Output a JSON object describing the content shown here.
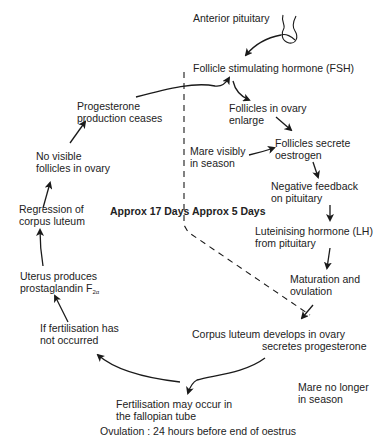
{
  "diagram": {
    "colors": {
      "text": "#222222",
      "lines": "#1a1a1a",
      "background": "#ffffff"
    },
    "nodes": {
      "anterior_pituitary": {
        "lines": [
          "Anterior pituitary"
        ]
      },
      "fsh": {
        "lines": [
          "Follicle stimulating hormone (FSH)"
        ]
      },
      "follicles_enlarge": {
        "lines": [
          "Follicles in ovary",
          "enlarge"
        ]
      },
      "mare_in_season": {
        "lines": [
          "Mare visibly",
          "in season"
        ]
      },
      "follicles_oestrogen": {
        "lines": [
          "Follicles secrete",
          "oestrogen"
        ]
      },
      "negative_feedback": {
        "lines": [
          "Negative feedback",
          "on pituitary"
        ]
      },
      "lh": {
        "lines": [
          "Luteinising hormone (LH)",
          "from pituitary"
        ]
      },
      "maturation": {
        "lines": [
          "Maturation and",
          "ovulation"
        ]
      },
      "corpus_luteum": {
        "lines": [
          "Corpus luteum develops in ovary",
          "secretes progesterone"
        ]
      },
      "mare_no_longer": {
        "lines": [
          "Mare no longer",
          "in season"
        ]
      },
      "fertilisation": {
        "lines": [
          "Fertilisation may occur in",
          "the fallopian tube"
        ]
      },
      "if_not_fertilised": {
        "lines": [
          "If  fertilisation has",
          "not occurred"
        ]
      },
      "uterus": {
        "lines": [
          "Uterus produces",
          "prostaglandin F"
        ],
        "subscript": "2α"
      },
      "regression": {
        "lines": [
          "Regression of",
          "corpus luteum"
        ]
      },
      "no_follicles": {
        "lines": [
          "No visible",
          "follicles in ovary"
        ]
      },
      "progesterone_ceases": {
        "lines": [
          "Progesterone",
          "production ceases"
        ]
      }
    },
    "phases": {
      "dioestrus": "Approx 17 Days",
      "oestrus": "Approx 5 Days"
    },
    "footer": "Ovulation : 24 hours before end of oestrus",
    "icons": {
      "pituitary": "pituitary-gland-icon"
    }
  }
}
